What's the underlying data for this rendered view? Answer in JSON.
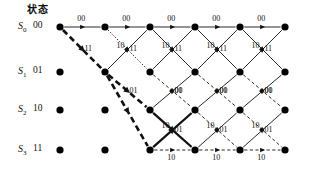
{
  "diagram": {
    "type": "trellis",
    "header": "状态",
    "width": 315,
    "height": 184,
    "colors": {
      "ink": "#111111",
      "node": "#000000",
      "survivor": "#000000"
    },
    "geometry": {
      "columns_x": [
        60,
        105,
        150,
        195,
        240,
        285
      ],
      "rows_y": [
        27,
        72,
        110,
        150
      ],
      "node_radius": 3.6
    }
  },
  "states": [
    {
      "name": "S",
      "index": "0",
      "bits": "00",
      "row": 0,
      "nodes_from_column": 0
    },
    {
      "name": "S",
      "index": "1",
      "bits": "01",
      "row": 1,
      "nodes_from_column": 0
    },
    {
      "name": "S",
      "index": "2",
      "bits": "10",
      "row": 2,
      "nodes_from_column": 0
    },
    {
      "name": "S",
      "index": "3",
      "bits": "11",
      "row": 3,
      "nodes_from_column": 0
    }
  ],
  "nodes": [
    {
      "col": 0,
      "row": 0
    },
    {
      "col": 1,
      "row": 0
    },
    {
      "col": 2,
      "row": 0
    },
    {
      "col": 3,
      "row": 0
    },
    {
      "col": 4,
      "row": 0
    },
    {
      "col": 5,
      "row": 0
    },
    {
      "col": 0,
      "row": 1
    },
    {
      "col": 1,
      "row": 1
    },
    {
      "col": 2,
      "row": 1
    },
    {
      "col": 3,
      "row": 1
    },
    {
      "col": 4,
      "row": 1
    },
    {
      "col": 5,
      "row": 1
    },
    {
      "col": 0,
      "row": 2
    },
    {
      "col": 1,
      "row": 2
    },
    {
      "col": 2,
      "row": 2
    },
    {
      "col": 3,
      "row": 2
    },
    {
      "col": 4,
      "row": 2
    },
    {
      "col": 5,
      "row": 2
    },
    {
      "col": 0,
      "row": 3
    },
    {
      "col": 1,
      "row": 3
    },
    {
      "col": 2,
      "row": 3
    },
    {
      "col": 3,
      "row": 3
    },
    {
      "col": 4,
      "row": 3
    },
    {
      "col": 5,
      "row": 3
    }
  ],
  "edges": [
    {
      "from": [
        0,
        0
      ],
      "to": [
        1,
        0
      ],
      "style": "solid",
      "label": "00",
      "lpos": "above-mid"
    },
    {
      "from": [
        1,
        0
      ],
      "to": [
        2,
        0
      ],
      "style": "solid",
      "label": "00",
      "lpos": "above-mid"
    },
    {
      "from": [
        2,
        0
      ],
      "to": [
        3,
        0
      ],
      "style": "solid",
      "label": "00",
      "lpos": "above-mid"
    },
    {
      "from": [
        3,
        0
      ],
      "to": [
        4,
        0
      ],
      "style": "solid",
      "label": "00",
      "lpos": "above-mid"
    },
    {
      "from": [
        4,
        0
      ],
      "to": [
        5,
        0
      ],
      "style": "solid",
      "label": "00",
      "lpos": "above-mid"
    },
    {
      "from": [
        0,
        0
      ],
      "to": [
        1,
        1
      ],
      "style": "bold-dashed",
      "label": "11",
      "lpos": "right-mid"
    },
    {
      "from": [
        1,
        0
      ],
      "to": [
        2,
        1
      ],
      "style": "dotted",
      "label": "11",
      "lpos": "right-mid"
    },
    {
      "from": [
        2,
        0
      ],
      "to": [
        3,
        1
      ],
      "style": "solid",
      "label": "11",
      "lpos": "right-mid"
    },
    {
      "from": [
        3,
        0
      ],
      "to": [
        4,
        1
      ],
      "style": "solid",
      "label": "11",
      "lpos": "right-mid"
    },
    {
      "from": [
        4,
        0
      ],
      "to": [
        5,
        1
      ],
      "style": "solid",
      "label": "11",
      "lpos": "right-mid"
    },
    {
      "from": [
        1,
        1
      ],
      "to": [
        2,
        2
      ],
      "style": "bold-dashed",
      "label": "01",
      "lpos": "right-mid"
    },
    {
      "from": [
        2,
        1
      ],
      "to": [
        3,
        2
      ],
      "style": "dashed",
      "label": "01",
      "lpos": "right-mid"
    },
    {
      "from": [
        3,
        1
      ],
      "to": [
        4,
        2
      ],
      "style": "dashed",
      "label": "01",
      "lpos": "right-mid"
    },
    {
      "from": [
        4,
        1
      ],
      "to": [
        5,
        2
      ],
      "style": "dashed",
      "label": "01",
      "lpos": "right-mid"
    },
    {
      "from": [
        1,
        1
      ],
      "to": [
        2,
        0
      ],
      "style": "solid",
      "label": "10",
      "lpos": "left-mid"
    },
    {
      "from": [
        2,
        1
      ],
      "to": [
        3,
        0
      ],
      "style": "solid",
      "label": "10",
      "lpos": "left-mid"
    },
    {
      "from": [
        3,
        1
      ],
      "to": [
        4,
        0
      ],
      "style": "solid",
      "label": "10",
      "lpos": "left-mid"
    },
    {
      "from": [
        4,
        1
      ],
      "to": [
        5,
        0
      ],
      "style": "solid",
      "label": "10",
      "lpos": "left-mid"
    },
    {
      "from": [
        2,
        2
      ],
      "to": [
        3,
        1
      ],
      "style": "solid",
      "label": "00",
      "lpos": "right-mid"
    },
    {
      "from": [
        3,
        2
      ],
      "to": [
        4,
        1
      ],
      "style": "solid",
      "label": "00",
      "lpos": "right-mid"
    },
    {
      "from": [
        4,
        2
      ],
      "to": [
        5,
        1
      ],
      "style": "solid",
      "label": "00",
      "lpos": "right-mid"
    },
    {
      "from": [
        2,
        2
      ],
      "to": [
        3,
        3
      ],
      "style": "bold-solid",
      "label": "01",
      "lpos": "right-mid"
    },
    {
      "from": [
        3,
        2
      ],
      "to": [
        4,
        3
      ],
      "style": "dashed",
      "label": "01",
      "lpos": "right-mid"
    },
    {
      "from": [
        4,
        2
      ],
      "to": [
        5,
        3
      ],
      "style": "dashed",
      "label": "01",
      "lpos": "right-mid"
    },
    {
      "from": [
        2,
        3
      ],
      "to": [
        3,
        2
      ],
      "style": "bold-solid",
      "label": "10",
      "lpos": "left-mid"
    },
    {
      "from": [
        3,
        3
      ],
      "to": [
        4,
        2
      ],
      "style": "solid",
      "label": "10",
      "lpos": "left-mid"
    },
    {
      "from": [
        4,
        3
      ],
      "to": [
        5,
        2
      ],
      "style": "solid",
      "label": "10",
      "lpos": "left-mid"
    },
    {
      "from": [
        2,
        3
      ],
      "to": [
        3,
        3
      ],
      "style": "dashed",
      "label": "10",
      "lpos": "below-mid"
    },
    {
      "from": [
        3,
        3
      ],
      "to": [
        4,
        3
      ],
      "style": "dashed",
      "label": "10",
      "lpos": "below-mid"
    },
    {
      "from": [
        4,
        3
      ],
      "to": [
        5,
        3
      ],
      "style": "dashed",
      "label": "10",
      "lpos": "below-mid"
    },
    {
      "from": [
        1,
        1
      ],
      "to": [
        2,
        3
      ],
      "style": "bold-dashed",
      "label": "",
      "lpos": "none"
    }
  ],
  "survivor_path": {
    "description": "bold path",
    "nodes": [
      [
        0,
        0
      ],
      [
        1,
        1
      ],
      [
        2,
        3
      ],
      [
        3,
        2
      ]
    ]
  }
}
